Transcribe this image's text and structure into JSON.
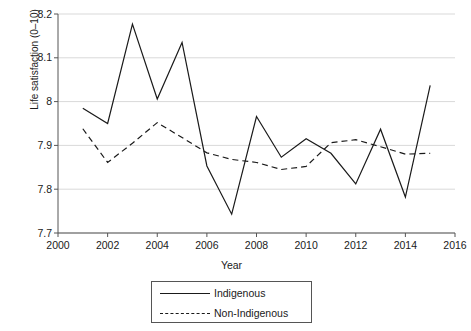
{
  "chart_data": {
    "type": "line",
    "title": "",
    "xlabel": "Year",
    "ylabel": "Life satisfaction (0–10)",
    "xlim": [
      2000,
      2016
    ],
    "ylim": [
      7.7,
      8.2
    ],
    "xticks": [
      "2000",
      "2002",
      "2004",
      "2006",
      "2008",
      "2010",
      "2012",
      "2014",
      "2016"
    ],
    "yticks": [
      "7.7",
      "7.8",
      "7.9",
      "8",
      "8.1",
      "8.2"
    ],
    "grid": "horizontal",
    "legend_position": "below-axes",
    "x": [
      2001,
      2002,
      2003,
      2004,
      2005,
      2006,
      2007,
      2008,
      2009,
      2010,
      2011,
      2012,
      2013,
      2014,
      2015
    ],
    "series": [
      {
        "name": "Indigenous",
        "style": "solid",
        "color": "#1a1a1a",
        "values": [
          7.985,
          7.95,
          8.177,
          8.006,
          8.135,
          7.853,
          7.743,
          7.966,
          7.873,
          7.915,
          7.882,
          7.812,
          7.937,
          7.782,
          8.037
        ]
      },
      {
        "name": "Non-Indigenous",
        "style": "dashed",
        "color": "#1a1a1a",
        "values": [
          7.938,
          7.861,
          7.905,
          7.952,
          7.918,
          7.883,
          7.868,
          7.861,
          7.845,
          7.852,
          7.906,
          7.913,
          7.897,
          7.88,
          7.882
        ]
      }
    ]
  },
  "legend": {
    "items": [
      {
        "label": "Indigenous",
        "style": "solid"
      },
      {
        "label": "Non-Indigenous",
        "style": "dashed"
      }
    ]
  }
}
